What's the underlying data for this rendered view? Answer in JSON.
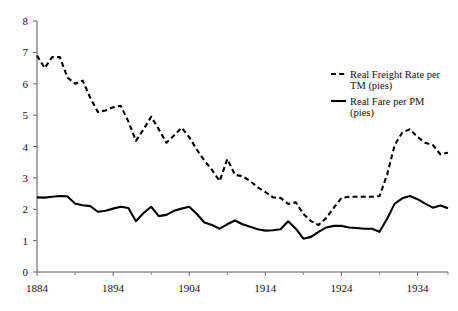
{
  "chart_data": {
    "type": "line",
    "title": "",
    "subtitle": "",
    "xlabel": "",
    "ylabel": "",
    "xlim": [
      1884,
      1938
    ],
    "ylim": [
      0,
      8
    ],
    "grid": false,
    "legend_position": "top-right",
    "x_ticks": [
      "1884",
      "1894",
      "1904",
      "1914",
      "1924",
      "1934"
    ],
    "x_tick_values": [
      1884,
      1894,
      1904,
      1914,
      1924,
      1934
    ],
    "x_minor_tick_values": [
      1889,
      1899,
      1909,
      1919,
      1929,
      1938
    ],
    "y_ticks": [
      "0",
      "1",
      "2",
      "3",
      "4",
      "5",
      "6",
      "7",
      "8"
    ],
    "y_tick_values": [
      0,
      1,
      2,
      3,
      4,
      5,
      6,
      7,
      8
    ],
    "x": [
      1884,
      1885,
      1886,
      1887,
      1888,
      1889,
      1890,
      1891,
      1892,
      1893,
      1894,
      1895,
      1896,
      1897,
      1898,
      1899,
      1900,
      1901,
      1902,
      1903,
      1904,
      1905,
      1906,
      1907,
      1908,
      1909,
      1910,
      1911,
      1912,
      1913,
      1914,
      1915,
      1916,
      1917,
      1918,
      1919,
      1920,
      1921,
      1922,
      1923,
      1924,
      1925,
      1926,
      1927,
      1928,
      1929,
      1930,
      1931,
      1932,
      1933,
      1934,
      1935,
      1936,
      1937,
      1938
    ],
    "series": [
      {
        "name": "Real Freight Rate per TM (pies)",
        "style": "dashed",
        "color": "#000000",
        "values": [
          6.9,
          6.5,
          6.85,
          6.85,
          6.2,
          6.0,
          6.1,
          5.55,
          5.1,
          5.15,
          5.25,
          5.3,
          4.8,
          4.18,
          4.55,
          4.95,
          4.55,
          4.12,
          4.35,
          4.6,
          4.3,
          3.9,
          3.55,
          3.25,
          2.9,
          3.6,
          3.1,
          3.05,
          2.9,
          2.7,
          2.55,
          2.38,
          2.36,
          2.17,
          2.22,
          1.85,
          1.62,
          1.5,
          1.72,
          2.05,
          2.36,
          2.4,
          2.4,
          2.4,
          2.4,
          2.42,
          3.1,
          4.05,
          4.45,
          4.55,
          4.3,
          4.12,
          4.05,
          3.75,
          3.8
        ]
      },
      {
        "name": "Real Fare per PM (pies)",
        "style": "solid",
        "color": "#000000",
        "values": [
          2.38,
          2.37,
          2.4,
          2.42,
          2.41,
          2.18,
          2.13,
          2.1,
          1.92,
          1.95,
          2.02,
          2.08,
          2.04,
          1.62,
          1.88,
          2.08,
          1.78,
          1.82,
          1.95,
          2.02,
          2.08,
          1.85,
          1.58,
          1.5,
          1.38,
          1.52,
          1.64,
          1.52,
          1.44,
          1.36,
          1.32,
          1.33,
          1.36,
          1.62,
          1.38,
          1.06,
          1.12,
          1.28,
          1.42,
          1.47,
          1.47,
          1.42,
          1.4,
          1.38,
          1.38,
          1.28,
          1.7,
          2.18,
          2.35,
          2.42,
          2.32,
          2.18,
          2.05,
          2.12,
          2.03
        ]
      }
    ],
    "legend": [
      {
        "label_line1": "Real Freight Rate per",
        "label_line2": "TM (pies)",
        "style": "dashed"
      },
      {
        "label_line1": "Real Fare per PM",
        "label_line2": "(pies)",
        "style": "solid"
      }
    ]
  }
}
